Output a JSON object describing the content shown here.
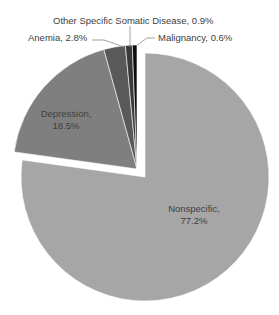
{
  "chart_data": {
    "type": "pie",
    "title": "",
    "categories": [
      "Nonspecific",
      "Depression",
      "Anemia",
      "Other Specific Somatic Disease",
      "Malignancy"
    ],
    "values": [
      77.2,
      18.5,
      2.8,
      0.9,
      0.6
    ],
    "unit": "%",
    "colors": [
      "#a6a6a6",
      "#7f7f7f",
      "#595959",
      "#3a3a3a",
      "#0d0d0d"
    ],
    "exploded": [
      "Depression",
      "Anemia",
      "Other Specific Somatic Disease",
      "Malignancy"
    ],
    "labels": [
      {
        "name": "Nonspecific",
        "text_line1": "Nonspecific,",
        "text_line2": "77.2%"
      },
      {
        "name": "Depression",
        "text_line1": "Depression,",
        "text_line2": "18.5%"
      },
      {
        "name": "Anemia",
        "text": "Anemia, 2.8%"
      },
      {
        "name": "Other Specific Somatic Disease",
        "text": "Other Specific Somatic Disease, 0.9%"
      },
      {
        "name": "Malignancy",
        "text": "Malignancy, 0.6%"
      }
    ],
    "legend": "none (data labels on slices)"
  }
}
